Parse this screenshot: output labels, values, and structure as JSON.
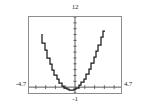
{
  "chart_data": {
    "type": "line",
    "title": "",
    "subtitle": "",
    "xlabel": "",
    "ylabel": "",
    "grid": false,
    "legend_position": "none",
    "display_style": "graphing-calculator-window",
    "xlim": [
      -4.7,
      4.7
    ],
    "ylim": [
      -1,
      12
    ],
    "x_tick_step": 1,
    "y_tick_step": 1,
    "x_axis_position": 0,
    "y_axis_position": 0,
    "curve_color": "#1a1a1a",
    "axis_color": "#4a4a4a",
    "frame_color": "#8d8d8d",
    "vertex": [
      -0.25,
      -0.5
    ],
    "series": [
      {
        "name": "parabola",
        "x": [
          -3.35,
          -3.1,
          -2.85,
          -2.6,
          -2.35,
          -2.1,
          -1.85,
          -1.6,
          -1.35,
          -1.1,
          -0.85,
          -0.6,
          -0.35,
          -0.1,
          0.15,
          0.4,
          0.65,
          0.9,
          1.15,
          1.4,
          1.65,
          1.9,
          2.15,
          2.4,
          2.65,
          2.9,
          3.1
        ],
        "y": [
          9.1,
          7.63,
          6.3,
          5.02,
          3.91,
          2.92,
          2.06,
          1.32,
          0.71,
          0.22,
          -0.14,
          -0.38,
          -0.49,
          -0.48,
          -0.34,
          -0.08,
          0.31,
          0.82,
          1.46,
          2.22,
          3.1,
          4.11,
          5.24,
          6.11,
          7.26,
          8.53,
          9.61
        ]
      }
    ],
    "labels": {
      "ymax": "12",
      "xmin": "-4.7",
      "xmax": "4.7",
      "ymin": "-1"
    }
  }
}
